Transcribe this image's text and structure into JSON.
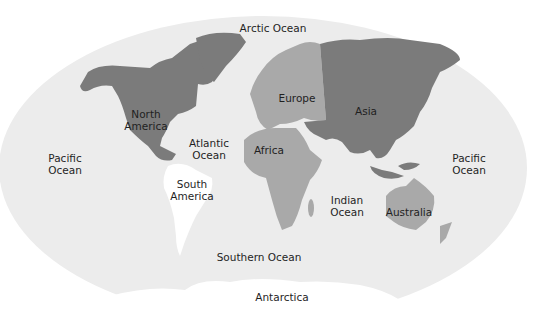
{
  "colors": {
    "ocean": "#ececec",
    "dark_continent": "#7b7b7b",
    "mid_continent": "#a9a9a9",
    "light_continent": "#ffffff",
    "text": "#1f1f1f"
  },
  "continents": [
    {
      "id": "north-america",
      "label": "North\nAmerica",
      "line1": "North",
      "line2": "America",
      "shade": "dark"
    },
    {
      "id": "south-america",
      "label": "South\nAmerica",
      "line1": "South",
      "line2": "America",
      "shade": "white"
    },
    {
      "id": "europe",
      "label": "Europe",
      "shade": "mid"
    },
    {
      "id": "africa",
      "label": "Africa",
      "shade": "mid"
    },
    {
      "id": "asia",
      "label": "Asia",
      "shade": "dark"
    },
    {
      "id": "australia",
      "label": "Australia",
      "shade": "mid"
    },
    {
      "id": "antarctica",
      "label": "Antarctica",
      "shade": "white"
    }
  ],
  "oceans": [
    {
      "id": "arctic",
      "label": "Arctic Ocean"
    },
    {
      "id": "atlantic",
      "line1": "Atlantic",
      "line2": "Ocean"
    },
    {
      "id": "pacific-west",
      "line1": "Pacific",
      "line2": "Ocean"
    },
    {
      "id": "pacific-east",
      "line1": "Pacific",
      "line2": "Ocean"
    },
    {
      "id": "indian",
      "line1": "Indian",
      "line2": "Ocean"
    },
    {
      "id": "southern",
      "label": "Southern Ocean"
    }
  ]
}
